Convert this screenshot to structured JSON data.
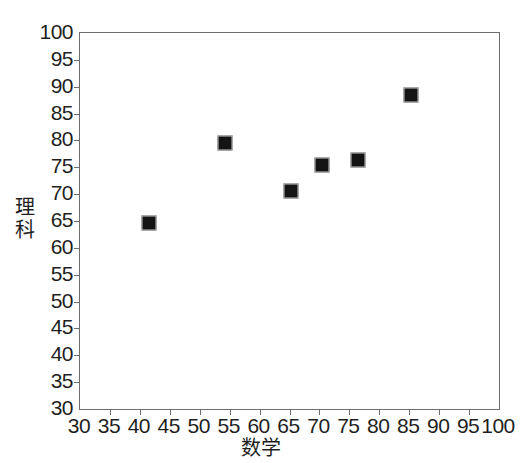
{
  "chart_data": {
    "type": "scatter",
    "title": "",
    "xlabel": "数学",
    "ylabel": "理科",
    "xlim": [
      30,
      100
    ],
    "ylim": [
      30,
      100
    ],
    "xticks": [
      30,
      35,
      40,
      45,
      50,
      55,
      60,
      65,
      70,
      75,
      80,
      85,
      90,
      95,
      100
    ],
    "yticks": [
      30,
      35,
      40,
      45,
      50,
      55,
      60,
      65,
      70,
      75,
      80,
      85,
      90,
      95,
      100
    ],
    "grid": false,
    "legend": false,
    "marker_style": "filled-square",
    "marker_color": "#141414",
    "points": [
      {
        "x": 41.5,
        "y": 64.6
      },
      {
        "x": 54.3,
        "y": 79.6
      },
      {
        "x": 65.2,
        "y": 70.6
      },
      {
        "x": 70.5,
        "y": 75.5
      },
      {
        "x": 76.4,
        "y": 76.4
      },
      {
        "x": 85.3,
        "y": 88.4
      }
    ]
  },
  "axes": {
    "y_title": "理科",
    "x_title": "数学",
    "y_tick_labels": [
      "100",
      "95",
      "90",
      "85",
      "80",
      "75",
      "70",
      "65",
      "60",
      "55",
      "50",
      "45",
      "40",
      "35",
      "30"
    ],
    "x_tick_labels": [
      "30",
      "35",
      "40",
      "45",
      "50",
      "55",
      "60",
      "65",
      "70",
      "75",
      "80",
      "85",
      "90",
      "95",
      "100"
    ]
  },
  "colors": {
    "frame": "#6e6e6e",
    "text": "#1f1f1f",
    "marker_fill": "#141414",
    "marker_edge": "#c9c9c9",
    "background": "#ffffff"
  }
}
